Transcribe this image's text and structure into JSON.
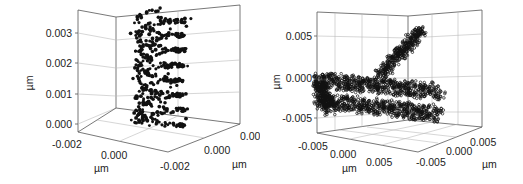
{
  "chart_data": [
    {
      "type": "scatter3d",
      "title": "",
      "description": "3D scatter of a double-helix (DNA-like) structure, black filled spheres",
      "xlabel": "µm",
      "ylabel": "µm",
      "zlabel": "µm",
      "x_ticks": [
        "-0.002",
        "0.000"
      ],
      "y_ticks": [
        "-0.002",
        "0.000",
        "0.002"
      ],
      "z_ticks": [
        "0.000",
        "0.001",
        "0.002",
        "0.003"
      ],
      "zlim": [
        -0.0001,
        0.0036
      ],
      "xlim": [
        -0.0025,
        0.0025
      ],
      "ylim": [
        -0.0025,
        0.0025
      ],
      "grid": true,
      "marker_color": "#111111"
    },
    {
      "type": "scatter3d",
      "title": "",
      "description": "3D scatter of a folded helix structure: a diagonal helix segment rising to the upper right plus two horizontal folded helix segments, open black markers",
      "xlabel": "µm",
      "ylabel": "µm",
      "zlabel": "µm",
      "x_ticks": [
        "-0.005",
        "0.000",
        "0.005"
      ],
      "y_ticks": [
        "-0.005",
        "0.000",
        "0.005"
      ],
      "z_ticks": [
        "-0.005",
        "0.000",
        "0.005"
      ],
      "zlim": [
        -0.007,
        0.0075
      ],
      "xlim": [
        -0.007,
        0.008
      ],
      "ylim": [
        -0.008,
        0.007
      ],
      "grid": true,
      "marker_color": "#111111"
    }
  ],
  "panels": {
    "left": {
      "z_ticks": [
        "0.003",
        "0.002",
        "0.001",
        "0.000"
      ],
      "x_ticks": [
        "-0.002",
        "0.000"
      ],
      "y_ticks": [
        "-0.002",
        "0.000",
        "0.002"
      ],
      "z_unit": "µm",
      "x_unit": "µm",
      "y_unit": "µm"
    },
    "right": {
      "z_ticks": [
        "0.005",
        "0.000",
        "-0.005"
      ],
      "x_ticks": [
        "-0.005",
        "0.000",
        "0.005"
      ],
      "y_ticks": [
        "-0.005",
        "0.000",
        "0.005"
      ],
      "z_unit": "µm",
      "x_unit": "µm",
      "y_unit": "µm"
    }
  }
}
